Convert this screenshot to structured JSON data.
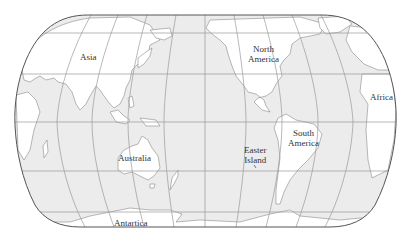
{
  "map": {
    "projection": "pseudo-cylindrical (Pacific-centered world map)",
    "colors": {
      "ocean": "#ececec",
      "land": "#ffffff",
      "coastline": "#8a8a8a",
      "graticule": "#9a9a9a",
      "border": "#555555",
      "label": "#333333"
    },
    "labels": {
      "asia": "Asia",
      "north_america_1": "North",
      "north_america_2": "America",
      "africa": "Africa",
      "australia": "Australia",
      "easter_island_1": "Easter",
      "easter_island_2": "Island",
      "south_america_1": "South",
      "south_america_2": "America",
      "antarctica": "Antartica"
    }
  }
}
